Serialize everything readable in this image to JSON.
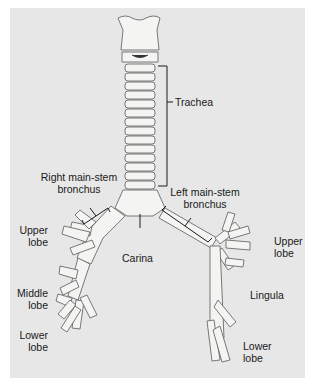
{
  "figure": {
    "colors": {
      "background": "#e7e7e7",
      "airway_fill": "#f4f4f2",
      "outline": "#6a6a6a",
      "leader_line": "#1a1a1a"
    }
  },
  "labels": {
    "trachea": "Trachea",
    "right_main_stem_line1": "Right main-stem",
    "right_main_stem_line2": "bronchus",
    "left_main_stem_line1": "Left main-stem",
    "left_main_stem_line2": "bronchus",
    "carina": "Carina",
    "right_upper_line1": "Upper",
    "right_upper_line2": "lobe",
    "right_middle_line1": "Middle",
    "right_middle_line2": "lobe",
    "right_lower_line1": "Lower",
    "right_lower_line2": "lobe",
    "left_upper_line1": "Upper",
    "left_upper_line2": "lobe",
    "lingula": "Lingula",
    "left_lower_line1": "Lower",
    "left_lower_line2": "lobe"
  }
}
